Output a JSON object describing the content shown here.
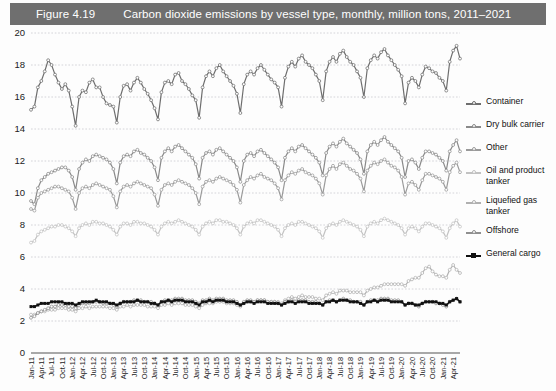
{
  "header": {
    "figure_number": "Figure 4.19",
    "title": "Carbon dioxide emissions by vessel type, monthly, million tons, 2011–2021",
    "bar_color": "#6f6f6f",
    "text_color": "#ffffff"
  },
  "legend": {
    "position": "right",
    "items": [
      {
        "label": "Container",
        "color": "#6e6e6e",
        "marker": "open-circle"
      },
      {
        "label": "Dry bulk carrier",
        "color": "#8a8a8a",
        "marker": "open-circle"
      },
      {
        "label": "Other",
        "color": "#9a9a9a",
        "marker": "open-circle"
      },
      {
        "label": "Oil and product\ntanker",
        "color": "#c2c2c2",
        "marker": "open-circle"
      },
      {
        "label": "Liquefied gas\ntanker",
        "color": "#b0b0b0",
        "marker": "open-circle"
      },
      {
        "label": "Offshore",
        "color": "#8f8f8f",
        "marker": "open-circle"
      },
      {
        "label": "General cargo",
        "color": "#111111",
        "marker": "solid-square"
      }
    ]
  },
  "chart_data": {
    "type": "line",
    "title": "Carbon dioxide emissions by vessel type, monthly, million tons, 2011–2021",
    "xlabel": "",
    "ylabel": "",
    "ylim": [
      0,
      20
    ],
    "ytick_step": 2,
    "yticks": [
      0,
      2,
      4,
      6,
      8,
      10,
      12,
      14,
      16,
      18,
      20
    ],
    "grid": "horizontal-dashed",
    "legend_position": "right",
    "x_tick_labels": [
      "Jan-11",
      "Apr-11",
      "Jul-11",
      "Oct-11",
      "Jan-12",
      "Apr-12",
      "Jul-12",
      "Oct-12",
      "Jan-13",
      "Apr-13",
      "Jul-13",
      "Oct-13",
      "Jan-14",
      "Apr-14",
      "Jul-14",
      "Oct-14",
      "Jan-15",
      "Apr-15",
      "Jul-15",
      "Oct-15",
      "Jan-16",
      "Apr-16",
      "Jul-16",
      "Oct-16",
      "Jan-17",
      "Apr-17",
      "Jul-17",
      "Oct-17",
      "Jan-18",
      "Apr-18",
      "Jul-18",
      "Oct-18",
      "Jan-19",
      "Apr-19",
      "Jul-19",
      "Oct-19",
      "Jan-20",
      "Apr-20",
      "Jul-20",
      "Oct-20",
      "Jan-21",
      "Apr-21"
    ],
    "x_tick_interval_months": 3,
    "x_start": "Jan-11",
    "x_end": "Jun-21",
    "n_points": 126,
    "series": [
      {
        "name": "Container",
        "color": "#6e6e6e",
        "values": [
          15.2,
          15.4,
          16.6,
          17.0,
          17.6,
          18.3,
          18.0,
          17.4,
          16.9,
          16.5,
          16.8,
          16.4,
          15.4,
          14.2,
          16.0,
          16.4,
          16.3,
          16.9,
          17.1,
          16.6,
          16.6,
          16.0,
          15.6,
          15.5,
          15.4,
          14.4,
          16.0,
          16.7,
          16.8,
          16.4,
          16.9,
          17.2,
          16.9,
          16.5,
          16.2,
          15.8,
          15.3,
          14.6,
          16.3,
          16.9,
          17.0,
          16.8,
          17.4,
          17.5,
          17.0,
          16.8,
          16.5,
          16.1,
          15.8,
          14.7,
          16.6,
          17.3,
          17.6,
          17.3,
          17.8,
          18.0,
          17.6,
          17.3,
          17.0,
          16.7,
          16.2,
          15.0,
          16.8,
          17.4,
          17.6,
          17.4,
          17.8,
          18.0,
          17.7,
          17.4,
          17.1,
          16.9,
          16.6,
          15.4,
          17.2,
          17.9,
          18.2,
          17.9,
          18.4,
          18.6,
          18.2,
          18.0,
          17.8,
          17.4,
          17.0,
          15.8,
          17.6,
          18.2,
          18.5,
          18.2,
          18.7,
          18.9,
          18.5,
          18.2,
          18.0,
          17.6,
          17.2,
          16.0,
          17.8,
          18.3,
          18.6,
          18.4,
          18.8,
          19.0,
          18.6,
          18.3,
          18.0,
          17.7,
          17.3,
          15.6,
          16.9,
          17.2,
          17.0,
          16.6,
          17.4,
          17.9,
          17.8,
          17.6,
          17.5,
          17.2,
          17.0,
          16.4,
          18.2,
          18.9,
          19.2,
          18.4
        ]
      },
      {
        "name": "Dry bulk carrier",
        "color": "#8a8a8a",
        "values": [
          9.5,
          9.3,
          10.3,
          10.8,
          11.0,
          11.2,
          11.3,
          11.4,
          11.5,
          11.6,
          11.6,
          11.4,
          11.0,
          10.2,
          11.5,
          11.9,
          12.1,
          12.0,
          12.3,
          12.4,
          12.3,
          12.2,
          12.1,
          11.9,
          11.5,
          10.6,
          11.9,
          12.3,
          12.4,
          12.3,
          12.6,
          12.7,
          12.5,
          12.4,
          12.2,
          12.0,
          11.6,
          10.8,
          12.2,
          12.6,
          12.8,
          12.6,
          12.9,
          13.0,
          12.8,
          12.6,
          12.4,
          12.2,
          11.8,
          10.9,
          12.2,
          12.5,
          12.6,
          12.4,
          12.7,
          12.8,
          12.6,
          12.4,
          12.2,
          12.0,
          11.6,
          10.7,
          12.0,
          12.4,
          12.5,
          12.3,
          12.6,
          12.7,
          12.5,
          12.3,
          12.1,
          11.9,
          11.6,
          10.8,
          12.2,
          12.6,
          12.8,
          12.6,
          12.9,
          13.0,
          12.8,
          12.6,
          12.4,
          12.2,
          11.9,
          11.1,
          12.5,
          12.9,
          13.1,
          12.9,
          13.2,
          13.4,
          13.1,
          12.9,
          12.7,
          12.5,
          12.1,
          11.2,
          12.6,
          13.0,
          13.2,
          13.0,
          13.3,
          13.5,
          13.2,
          13.0,
          12.8,
          12.6,
          12.2,
          11.0,
          12.0,
          12.1,
          11.9,
          11.5,
          12.2,
          12.6,
          12.6,
          12.5,
          12.4,
          12.2,
          12.0,
          11.4,
          12.6,
          13.0,
          13.3,
          12.6
        ]
      },
      {
        "name": "Other",
        "color": "#9a9a9a",
        "values": [
          9.0,
          8.9,
          9.7,
          10.0,
          10.1,
          10.2,
          10.3,
          10.4,
          10.4,
          10.3,
          10.2,
          10.1,
          9.7,
          9.0,
          10.0,
          10.3,
          10.4,
          10.3,
          10.5,
          10.6,
          10.5,
          10.4,
          10.3,
          10.2,
          9.8,
          9.1,
          10.1,
          10.4,
          10.5,
          10.4,
          10.6,
          10.7,
          10.6,
          10.5,
          10.4,
          10.3,
          9.9,
          9.2,
          10.2,
          10.5,
          10.6,
          10.5,
          10.7,
          10.8,
          10.7,
          10.6,
          10.5,
          10.3,
          10.0,
          9.3,
          10.4,
          10.7,
          10.8,
          10.7,
          10.9,
          11.0,
          10.9,
          10.8,
          10.7,
          10.5,
          10.2,
          9.4,
          10.5,
          10.8,
          11.0,
          10.9,
          11.1,
          11.2,
          11.0,
          10.9,
          10.8,
          10.6,
          10.3,
          9.6,
          10.8,
          11.1,
          11.3,
          11.2,
          11.4,
          11.5,
          11.3,
          11.2,
          11.1,
          10.9,
          10.6,
          9.9,
          11.1,
          11.5,
          11.7,
          11.5,
          11.8,
          11.9,
          11.7,
          11.5,
          11.4,
          11.2,
          10.9,
          10.1,
          11.4,
          11.7,
          11.9,
          11.8,
          12.0,
          12.1,
          11.9,
          11.7,
          11.6,
          11.4,
          11.0,
          9.9,
          10.6,
          10.7,
          10.5,
          10.2,
          10.8,
          11.2,
          11.2,
          11.1,
          11.0,
          10.9,
          10.7,
          10.2,
          11.3,
          11.7,
          11.9,
          11.3
        ]
      },
      {
        "name": "Oil and product tanker",
        "color": "#c2c2c2",
        "values": [
          6.9,
          7.0,
          7.4,
          7.6,
          7.7,
          7.8,
          7.9,
          7.9,
          8.0,
          8.0,
          7.9,
          7.8,
          7.6,
          7.3,
          7.8,
          8.0,
          8.1,
          8.0,
          8.2,
          8.2,
          8.1,
          8.1,
          8.0,
          7.9,
          7.7,
          7.4,
          7.9,
          8.1,
          8.1,
          8.0,
          8.2,
          8.2,
          8.1,
          8.1,
          8.0,
          7.9,
          7.7,
          7.4,
          7.9,
          8.1,
          8.2,
          8.1,
          8.2,
          8.3,
          8.2,
          8.1,
          8.0,
          7.9,
          7.7,
          7.4,
          7.9,
          8.1,
          8.2,
          8.1,
          8.3,
          8.3,
          8.2,
          8.2,
          8.1,
          8.0,
          7.8,
          7.4,
          7.9,
          8.1,
          8.2,
          8.1,
          8.3,
          8.3,
          8.2,
          8.1,
          8.0,
          7.9,
          7.7,
          7.3,
          7.8,
          8.0,
          8.1,
          8.0,
          8.2,
          8.2,
          8.1,
          8.0,
          7.9,
          7.8,
          7.6,
          7.2,
          7.8,
          8.0,
          8.1,
          8.0,
          8.2,
          8.3,
          8.2,
          8.1,
          8.0,
          7.9,
          7.7,
          7.3,
          7.9,
          8.1,
          8.2,
          8.1,
          8.3,
          8.4,
          8.3,
          8.2,
          8.1,
          8.0,
          7.8,
          7.4,
          7.8,
          7.9,
          7.8,
          7.6,
          7.9,
          8.1,
          8.1,
          8.0,
          7.9,
          7.8,
          7.6,
          7.2,
          7.8,
          8.1,
          8.3,
          7.9
        ]
      },
      {
        "name": "Liquefied gas tanker",
        "color": "#b0b0b0",
        "values": [
          2.4,
          2.4,
          2.5,
          2.6,
          2.6,
          2.7,
          2.7,
          2.7,
          2.8,
          2.8,
          2.8,
          2.7,
          2.7,
          2.6,
          2.8,
          2.8,
          2.9,
          2.8,
          2.9,
          2.9,
          2.9,
          2.9,
          2.9,
          2.8,
          2.8,
          2.7,
          2.9,
          2.9,
          3.0,
          2.9,
          3.0,
          3.0,
          3.0,
          3.0,
          2.9,
          2.9,
          2.9,
          2.8,
          3.0,
          3.0,
          3.1,
          3.0,
          3.1,
          3.1,
          3.1,
          3.0,
          3.0,
          3.0,
          2.9,
          2.8,
          3.0,
          3.1,
          3.1,
          3.1,
          3.2,
          3.2,
          3.2,
          3.1,
          3.1,
          3.1,
          3.0,
          2.9,
          3.1,
          3.2,
          3.2,
          3.2,
          3.3,
          3.3,
          3.3,
          3.2,
          3.2,
          3.2,
          3.2,
          3.1,
          3.3,
          3.4,
          3.5,
          3.4,
          3.5,
          3.6,
          3.5,
          3.5,
          3.5,
          3.4,
          3.4,
          3.3,
          3.6,
          3.7,
          3.8,
          3.7,
          3.9,
          3.9,
          3.9,
          3.8,
          3.8,
          3.8,
          3.8,
          3.6,
          3.9,
          4.0,
          4.1,
          4.1,
          4.2,
          4.3,
          4.3,
          4.3,
          4.3,
          4.3,
          4.3,
          4.2,
          4.5,
          4.6,
          4.7,
          4.7,
          5.0,
          5.3,
          5.4,
          5.1,
          4.9,
          4.8,
          4.8,
          4.7,
          5.2,
          5.5,
          5.2,
          5.0
        ]
      },
      {
        "name": "Offshore",
        "color": "#8f8f8f",
        "values": [
          2.2,
          2.3,
          2.5,
          2.6,
          2.7,
          2.8,
          2.9,
          2.9,
          3.0,
          3.0,
          3.0,
          2.9,
          2.9,
          2.8,
          3.0,
          3.1,
          3.1,
          3.1,
          3.2,
          3.2,
          3.2,
          3.1,
          3.1,
          3.1,
          3.0,
          2.9,
          3.1,
          3.2,
          3.2,
          3.2,
          3.3,
          3.3,
          3.3,
          3.2,
          3.2,
          3.2,
          3.1,
          3.0,
          3.2,
          3.3,
          3.3,
          3.3,
          3.4,
          3.4,
          3.4,
          3.3,
          3.3,
          3.3,
          3.2,
          3.1,
          3.3,
          3.3,
          3.4,
          3.3,
          3.4,
          3.4,
          3.4,
          3.3,
          3.3,
          3.3,
          3.2,
          3.0,
          3.2,
          3.3,
          3.3,
          3.2,
          3.3,
          3.3,
          3.3,
          3.2,
          3.2,
          3.2,
          3.1,
          3.0,
          3.2,
          3.2,
          3.3,
          3.2,
          3.3,
          3.3,
          3.3,
          3.2,
          3.2,
          3.2,
          3.1,
          3.0,
          3.2,
          3.3,
          3.3,
          3.2,
          3.3,
          3.4,
          3.3,
          3.3,
          3.2,
          3.2,
          3.2,
          3.0,
          3.2,
          3.3,
          3.3,
          3.3,
          3.4,
          3.4,
          3.4,
          3.3,
          3.3,
          3.3,
          3.2,
          3.0,
          3.1,
          3.1,
          3.0,
          2.9,
          3.1,
          3.2,
          3.2,
          3.2,
          3.1,
          3.1,
          3.0,
          2.9,
          3.2,
          3.3,
          3.4,
          3.2
        ]
      },
      {
        "name": "General cargo",
        "color": "#111111",
        "values": [
          2.9,
          2.9,
          3.0,
          3.1,
          3.1,
          3.1,
          3.2,
          3.2,
          3.2,
          3.2,
          3.1,
          3.1,
          3.1,
          3.0,
          3.1,
          3.2,
          3.2,
          3.2,
          3.2,
          3.3,
          3.2,
          3.2,
          3.2,
          3.1,
          3.1,
          3.0,
          3.1,
          3.2,
          3.2,
          3.2,
          3.2,
          3.3,
          3.2,
          3.2,
          3.2,
          3.1,
          3.1,
          3.0,
          3.2,
          3.2,
          3.3,
          3.2,
          3.3,
          3.3,
          3.3,
          3.2,
          3.2,
          3.2,
          3.1,
          3.0,
          3.2,
          3.2,
          3.3,
          3.2,
          3.3,
          3.3,
          3.3,
          3.2,
          3.2,
          3.2,
          3.1,
          3.0,
          3.1,
          3.2,
          3.2,
          3.1,
          3.2,
          3.2,
          3.2,
          3.1,
          3.1,
          3.1,
          3.1,
          3.0,
          3.1,
          3.2,
          3.2,
          3.1,
          3.2,
          3.2,
          3.2,
          3.1,
          3.1,
          3.1,
          3.1,
          3.0,
          3.2,
          3.2,
          3.3,
          3.2,
          3.3,
          3.3,
          3.3,
          3.2,
          3.2,
          3.2,
          3.1,
          3.0,
          3.2,
          3.2,
          3.3,
          3.2,
          3.3,
          3.3,
          3.3,
          3.2,
          3.2,
          3.2,
          3.2,
          3.0,
          3.1,
          3.1,
          3.0,
          3.0,
          3.1,
          3.2,
          3.2,
          3.2,
          3.2,
          3.1,
          3.1,
          3.0,
          3.2,
          3.3,
          3.4,
          3.2
        ]
      }
    ]
  }
}
